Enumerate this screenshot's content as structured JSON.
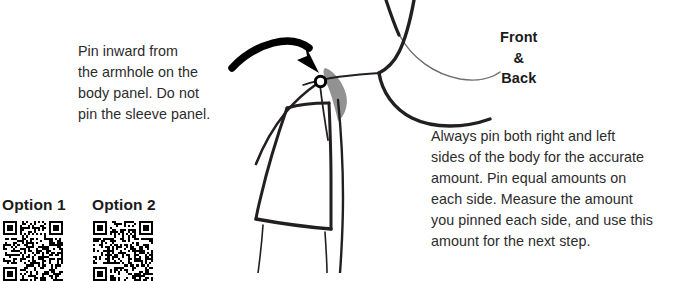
{
  "page": {
    "background_color": "#ffffff",
    "ink_color": "#231f20",
    "text_color": "#2b2b2b",
    "shadow_color": "#8c8c8c",
    "width": 677,
    "height": 273
  },
  "instructions": {
    "pin_inward": "Pin inward from\nthe armhole on the\nbody panel. Do not\npin the sleeve panel.",
    "always_pin": "Always pin both right and left\nsides of the body for the accurate\namount. Pin equal amounts on\neach side. Measure the amount\nyou pinned each side, and use this\namount for the next step."
  },
  "diagram": {
    "front_back_label": "Front\n&\nBack",
    "arrow_name": "curved-arrow-to-shoulder",
    "pin_name": "straight-pin"
  },
  "options": {
    "option_1": {
      "label": "Option 1",
      "qr_name": "qr-code-option-1"
    },
    "option_2": {
      "label": "Option 2",
      "qr_name": "qr-code-option-2"
    }
  }
}
